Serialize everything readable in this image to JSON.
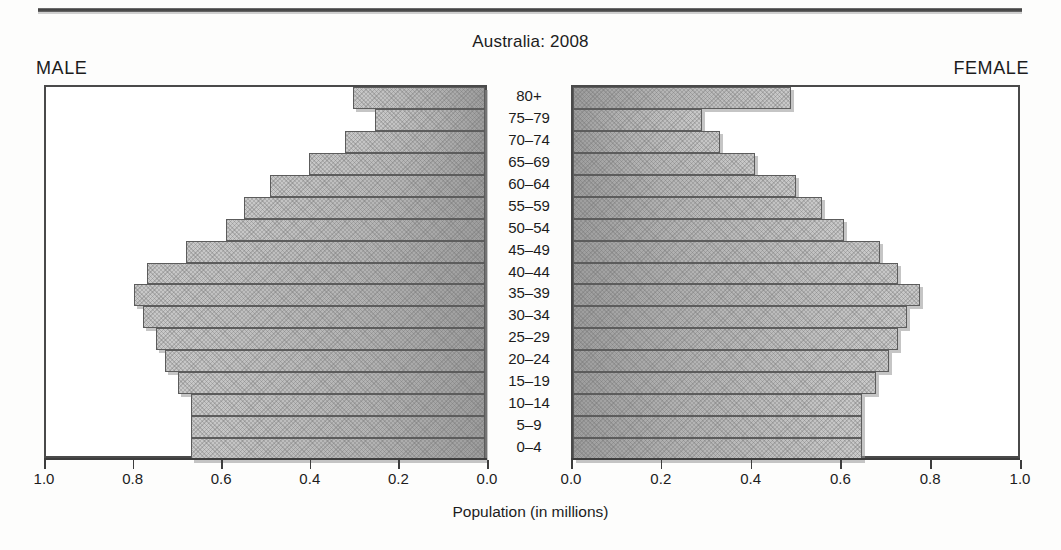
{
  "chart_data": {
    "type": "bar",
    "title": "Australia: 2008",
    "subtitle": "",
    "xlabel": "Population (in millions)",
    "ylabel": "",
    "orientation": "horizontal",
    "layout": "population-pyramid",
    "grid": false,
    "legend_position": "none",
    "left_panel_label": "MALE",
    "right_panel_label": "FEMALE",
    "categories": [
      "80+",
      "75–79",
      "70–74",
      "65–69",
      "60–64",
      "55–59",
      "50–54",
      "45–49",
      "40–44",
      "35–39",
      "30–34",
      "25–29",
      "20–24",
      "15–19",
      "10–14",
      "5–9",
      "0–4"
    ],
    "xlim_left": [
      1.0,
      0.0
    ],
    "xlim_right": [
      0.0,
      1.0
    ],
    "xticks_left": [
      "1.0",
      "0.8",
      "0.6",
      "0.4",
      "0.2",
      "0.0"
    ],
    "xticks_right": [
      "0.0",
      "0.2",
      "0.4",
      "0.6",
      "0.8",
      "1.0"
    ],
    "xtick_values_left": [
      1.0,
      0.8,
      0.6,
      0.4,
      0.2,
      0.0
    ],
    "xtick_values_right": [
      0.0,
      0.2,
      0.4,
      0.6,
      0.8,
      1.0
    ],
    "series": [
      {
        "name": "MALE",
        "side": "left",
        "values": [
          0.3,
          0.25,
          0.32,
          0.4,
          0.49,
          0.55,
          0.59,
          0.68,
          0.77,
          0.8,
          0.78,
          0.75,
          0.73,
          0.7,
          0.67,
          0.67,
          0.67
        ]
      },
      {
        "name": "FEMALE",
        "side": "right",
        "values": [
          0.49,
          0.29,
          0.33,
          0.41,
          0.5,
          0.56,
          0.61,
          0.69,
          0.73,
          0.78,
          0.75,
          0.73,
          0.71,
          0.68,
          0.65,
          0.65,
          0.65
        ]
      }
    ],
    "colors": {
      "bar_fill_light": "#c9c9c9",
      "bar_fill_dark": "#9d9d9d",
      "bar_border": "#5c5c5c",
      "frame": "#4a4a4a",
      "text": "#1c1c1c",
      "background": "#ffffff"
    }
  }
}
